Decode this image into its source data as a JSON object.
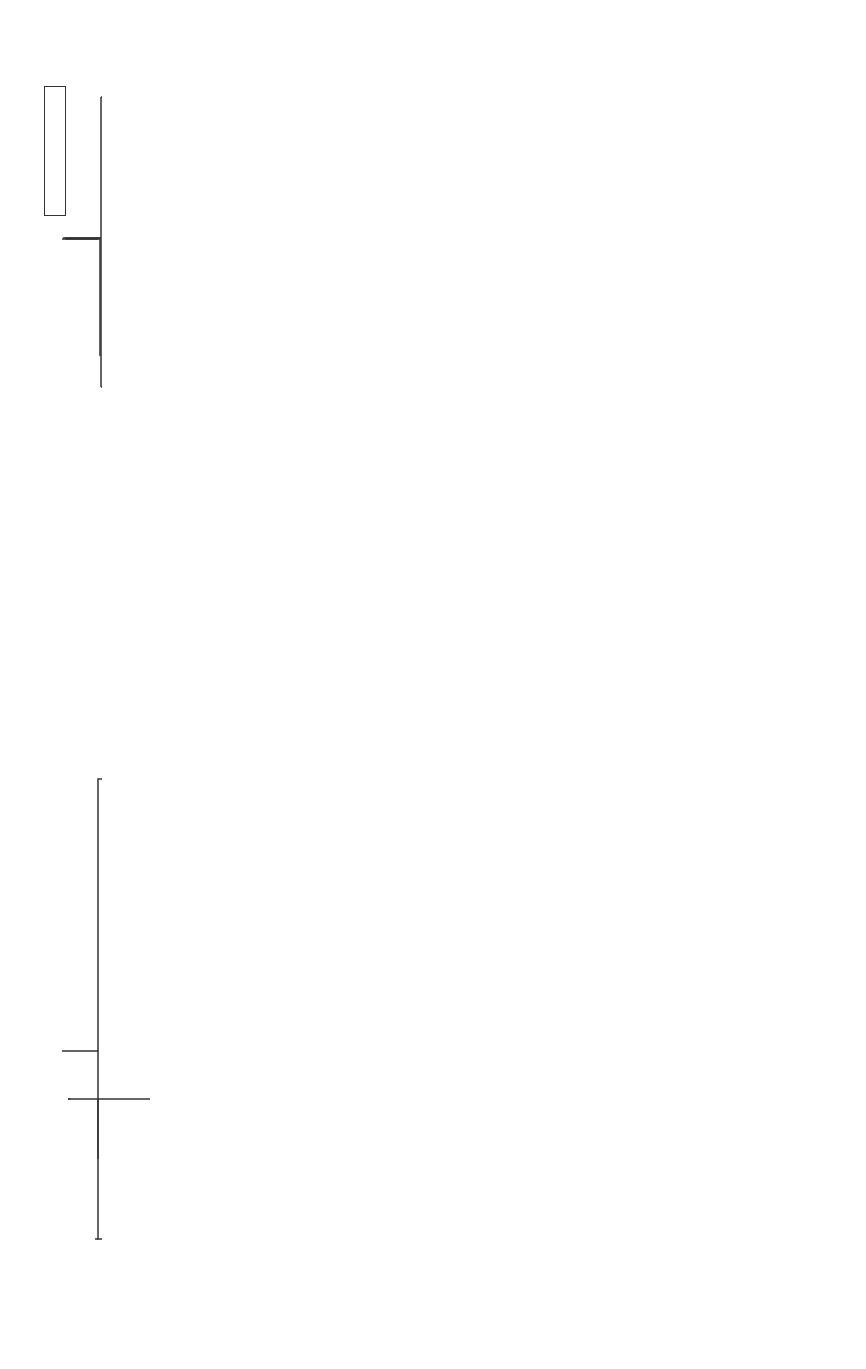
{
  "diagram": {
    "root": {
      "question": "Does Visual Acuity Improve\nwith Pinhole?"
    },
    "pinhole_branches": {
      "yes_label": "Yes",
      "no_label": "No",
      "yes_result": "Ophthalmology evaluation\nfor uncorrected refractive\nerror or media opacity",
      "no_result": "Possible neurologic\nvisual loss"
    },
    "unilateral": {
      "question": "Unilateral?\nAPD?",
      "yes_label": "Yes",
      "no_label": "No",
      "yes_result": "Pre-optic chiasm\nSuspect an optic\nneuropathy",
      "no_result": "Chiasm or\nretrochiasmal\nlesion, elevated\nICP, or infectious\nor toxic-\nmetabolic optic\nneuropathies"
    },
    "pattern": {
      "title": "Pattern of\nVisual Field\nLoss",
      "categories": [
        {
          "name": "Central\nscotoma",
          "detail": "Optic neuritis*\nFundus: Frequently\nnormal; Painful, onset\nover hours to days\nMRI brain/orbits with\ncontrast for optic nerve\nenhancement and brain\nT2 lesions Consider LP,\nserologies, and\nadmission for IV\nprednisolone"
        },
        {
          "name": "Altitudinal\nDeficit",
          "detail": "AION\nFundus: ONHE,\nhemorrhages\nPainless, sudden\nonset, APD, >50yrs\nConsider ESR for\nGCA, MRI if atypical\nASA 81mg and treat\nstroke risk factors"
        },
        {
          "name": "Peripheral\nconstriction,\nenlarged\nblind spot",
          "detail": "Papilledema\nFundus: ONHE\nMRI/MRV then\nconsider LP for\nopening\npressure, CSF\nstudies"
        },
        {
          "name": "Bitemporal\nDeficit",
          "detail": "Chiasm lesion\n(pituitary\nadenoma)\nFundus: pallor"
        },
        {
          "name": "Homonymous incongruous\nhemianopia, homonymous\nquadrantanopsia, and\nhomonymous congruous\nhemianopsia",
          "detail": "Optic tract, optic\nradiations and\noccipital lesions,\nrespectively"
        }
      ]
    },
    "final": {
      "label": "MRI Brain with contrast"
    }
  },
  "colors": {
    "line": "#333333",
    "text": "#1a1a1a",
    "background": "#ffffff"
  }
}
